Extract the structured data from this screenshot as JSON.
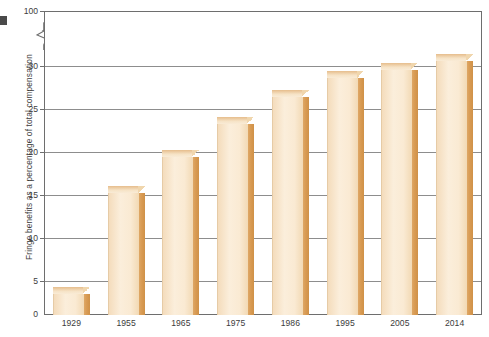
{
  "chart_data": {
    "type": "bar",
    "title": "",
    "subtitle": "",
    "xlabel": "",
    "ylabel": "Fringe benefits as a percentage of total compensation",
    "categories": [
      "1929",
      "1955",
      "1965",
      "1975",
      "1986",
      "1995",
      "2005",
      "2014"
    ],
    "values": [
      2.5,
      14.7,
      19.0,
      23.0,
      26.3,
      28.5,
      29.5,
      30.6
    ],
    "series": [
      {
        "name": "Fringe benefits as a percentage of total compensation",
        "values": [
          2.5,
          14.7,
          19.0,
          23.0,
          26.3,
          28.5,
          29.5,
          30.6
        ]
      }
    ],
    "ylim": [
      0,
      30
    ],
    "yticks": [
      "0",
      "5",
      "10",
      "15",
      "20",
      "25",
      "30",
      "100"
    ],
    "ytick_values": [
      0,
      5,
      10,
      15,
      20,
      25,
      30,
      100
    ],
    "y_axis_break": {
      "present": true,
      "between": [
        30,
        100
      ],
      "style": "zigzag"
    },
    "grid": true,
    "grid_axis": "y",
    "legend": "none",
    "bar_style": "3d-extruded",
    "colors": {
      "bar_front": "#faead3",
      "bar_side": "#d89a52",
      "bar_top": "#f2ddbd",
      "gridline": "#8d8d8d",
      "axis": "#6e6e6e",
      "text": "#3c3c3c",
      "background": "#ffffff"
    }
  },
  "axis": {
    "y_title": "Fringe benefits as a percentage of total compensation",
    "tick_100": "100",
    "tick_30": "30",
    "tick_25": "25",
    "tick_20": "20",
    "tick_15": "15",
    "tick_10": "10",
    "tick_5": "5",
    "tick_0": "0"
  }
}
